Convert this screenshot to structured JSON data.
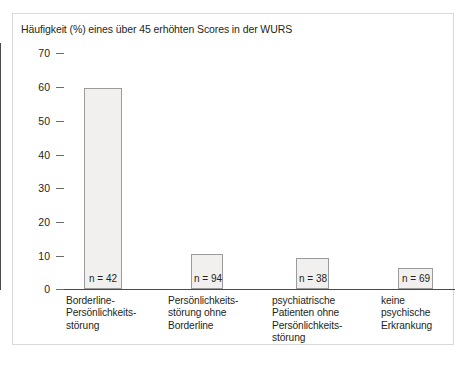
{
  "chart_data": {
    "type": "bar",
    "title": "Häufigkeit (%) eines über 45 erhöhten Scores in der WURS",
    "xlabel": "",
    "ylabel": "",
    "ylim": [
      0,
      70
    ],
    "yticks": [
      0,
      10,
      20,
      30,
      40,
      50,
      60,
      70
    ],
    "grid": false,
    "legend": "none",
    "categories": [
      "Borderline-Persönlichkeitsstörung",
      "Persönlichkeitsstörung ohne Borderline",
      "psychiatrische Patienten ohne Persönlichkeitsstörung",
      "keine psychische Erkrankung"
    ],
    "category_lines": [
      [
        "Borderline-",
        "Persönlichkeits-",
        "störung"
      ],
      [
        "Persönlichkeits-",
        "störung ohne",
        "Borderline"
      ],
      [
        "psychiatrische",
        "Patienten ohne",
        "Persönlichkeits-",
        "störung"
      ],
      [
        "keine",
        "psychische",
        "Erkrankung"
      ]
    ],
    "values": [
      59.5,
      10.5,
      9.2,
      6.3
    ],
    "n_labels": [
      "n = 42",
      "n = 94",
      "n = 38",
      "n = 69"
    ],
    "bar_fill": "#f1f0ef",
    "bar_stroke": "#9b9b9b",
    "axis_color": "#4a4a4a"
  },
  "ytick_labels": {
    "t0": "0",
    "t10": "10",
    "t20": "20",
    "t30": "30",
    "t40": "40",
    "t50": "50",
    "t60": "60",
    "t70": "70"
  }
}
